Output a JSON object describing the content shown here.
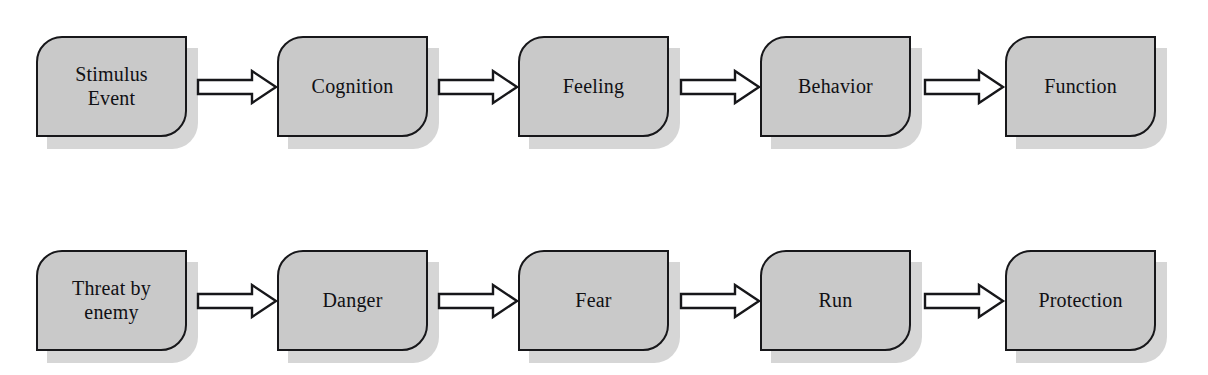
{
  "diagram": {
    "background_color": "#ffffff",
    "box_fill_color": "#c9c9c9",
    "box_stroke_color": "#17171a",
    "shadow_color": "#d6d6d6",
    "arrow_fill_color": "#ffffff",
    "arrow_stroke_color": "#17171a",
    "text_color": "#101014",
    "rows": [
      {
        "name": "general-model-row",
        "nodes": [
          {
            "id": "stimulus-event",
            "label": "Stimulus\nEvent",
            "x": 36
          },
          {
            "id": "cognition",
            "label": "Cognition",
            "x": 277
          },
          {
            "id": "feeling",
            "label": "Feeling",
            "x": 518
          },
          {
            "id": "behavior",
            "label": "Behavior",
            "x": 760
          },
          {
            "id": "function",
            "label": "Function",
            "x": 1005
          }
        ],
        "arrows": [
          {
            "id": "arrow-stimulus-to-cognition",
            "from": "stimulus-event",
            "to": "cognition",
            "x": 196
          },
          {
            "id": "arrow-cognition-to-feeling",
            "from": "cognition",
            "to": "feeling",
            "x": 437
          },
          {
            "id": "arrow-feeling-to-behavior",
            "from": "feeling",
            "to": "behavior",
            "x": 679
          },
          {
            "id": "arrow-behavior-to-function",
            "from": "behavior",
            "to": "function",
            "x": 923
          }
        ]
      },
      {
        "name": "example-instance-row",
        "nodes": [
          {
            "id": "threat-by-enemy",
            "label": "Threat by\nenemy",
            "x": 36
          },
          {
            "id": "danger",
            "label": "Danger",
            "x": 277
          },
          {
            "id": "fear",
            "label": "Fear",
            "x": 518
          },
          {
            "id": "run",
            "label": "Run",
            "x": 760
          },
          {
            "id": "protection",
            "label": "Protection",
            "x": 1005
          }
        ],
        "arrows": [
          {
            "id": "arrow-threat-to-danger",
            "from": "threat-by-enemy",
            "to": "danger",
            "x": 196
          },
          {
            "id": "arrow-danger-to-fear",
            "from": "danger",
            "to": "fear",
            "x": 437
          },
          {
            "id": "arrow-fear-to-run",
            "from": "fear",
            "to": "run",
            "x": 679
          },
          {
            "id": "arrow-run-to-protection",
            "from": "run",
            "to": "protection",
            "x": 923
          }
        ]
      }
    ]
  }
}
